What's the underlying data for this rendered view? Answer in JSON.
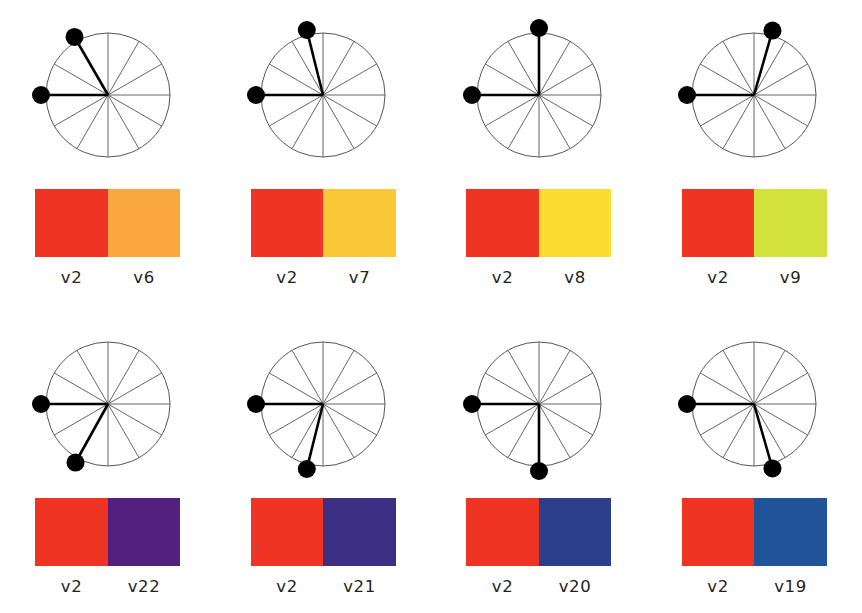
{
  "figure": {
    "type": "color-angle-panel-grid",
    "rows": 2,
    "columns": 4,
    "spoke_count": 12,
    "spoke_step_degrees": 30,
    "background_color": "#ffffff",
    "reference_color_name": "v2",
    "reference_color_hex": "#ef3423",
    "reference_angle_degrees": 180,
    "line_color": "#555555",
    "dot_color": "#000000",
    "label_color": "#231f20"
  },
  "panels": [
    {
      "id": "panel-v2-v6",
      "row": "top",
      "column": 1,
      "dial": {
        "reference_arm": {
          "label": "v2",
          "angle_degrees": 180
        },
        "variable_arm": {
          "label": "v6",
          "angle_degrees": 120
        },
        "angle_difference_degrees": 60
      },
      "swatch": {
        "left_label": "v2",
        "left_hex": "#ef3423",
        "right_label": "v6",
        "right_hex": "#f9a83f"
      }
    },
    {
      "id": "panel-v2-v7",
      "row": "top",
      "column": 2,
      "dial": {
        "reference_arm": {
          "label": "v2",
          "angle_degrees": 180
        },
        "variable_arm": {
          "label": "v7",
          "angle_degrees": 104
        },
        "angle_difference_degrees": 76
      },
      "swatch": {
        "left_label": "v2",
        "left_hex": "#ef3423",
        "right_label": "v7",
        "right_hex": "#f9c836"
      }
    },
    {
      "id": "panel-v2-v8",
      "row": "top",
      "column": 3,
      "dial": {
        "reference_arm": {
          "label": "v2",
          "angle_degrees": 180
        },
        "variable_arm": {
          "label": "v8",
          "angle_degrees": 90
        },
        "angle_difference_degrees": 90
      },
      "swatch": {
        "left_label": "v2",
        "left_hex": "#ef3423",
        "right_label": "v8",
        "right_hex": "#fbdc31"
      }
    },
    {
      "id": "panel-v2-v9",
      "row": "top",
      "column": 4,
      "dial": {
        "reference_arm": {
          "label": "v2",
          "angle_degrees": 180
        },
        "variable_arm": {
          "label": "v9",
          "angle_degrees": 74
        },
        "angle_difference_degrees": 106
      },
      "swatch": {
        "left_label": "v2",
        "left_hex": "#ef3423",
        "right_label": "v9",
        "right_hex": "#d2e13c"
      }
    },
    {
      "id": "panel-v2-v22",
      "row": "bottom",
      "column": 1,
      "dial": {
        "reference_arm": {
          "label": "v2",
          "angle_degrees": 180
        },
        "variable_arm": {
          "label": "v22",
          "angle_degrees": 241
        },
        "angle_difference_degrees": 61
      },
      "swatch": {
        "left_label": "v2",
        "left_hex": "#ef3423",
        "right_label": "v22",
        "right_hex": "#532080"
      }
    },
    {
      "id": "panel-v2-v21",
      "row": "bottom",
      "column": 2,
      "dial": {
        "reference_arm": {
          "label": "v2",
          "angle_degrees": 180
        },
        "variable_arm": {
          "label": "v21",
          "angle_degrees": 256
        },
        "angle_difference_degrees": 76
      },
      "swatch": {
        "left_label": "v2",
        "left_hex": "#ef3423",
        "right_label": "v21",
        "right_hex": "#3c2f84"
      }
    },
    {
      "id": "panel-v2-v20",
      "row": "bottom",
      "column": 3,
      "dial": {
        "reference_arm": {
          "label": "v2",
          "angle_degrees": 180
        },
        "variable_arm": {
          "label": "v20",
          "angle_degrees": 270
        },
        "angle_difference_degrees": 90
      },
      "swatch": {
        "left_label": "v2",
        "left_hex": "#ef3423",
        "right_label": "v20",
        "right_hex": "#2b3f8c"
      }
    },
    {
      "id": "panel-v2-v19",
      "row": "bottom",
      "column": 4,
      "dial": {
        "reference_arm": {
          "label": "v2",
          "angle_degrees": 180
        },
        "variable_arm": {
          "label": "v19",
          "angle_degrees": 286
        },
        "angle_difference_degrees": 106
      },
      "swatch": {
        "left_label": "v2",
        "left_hex": "#ef3423",
        "right_label": "v19",
        "right_hex": "#1f5499"
      }
    }
  ]
}
